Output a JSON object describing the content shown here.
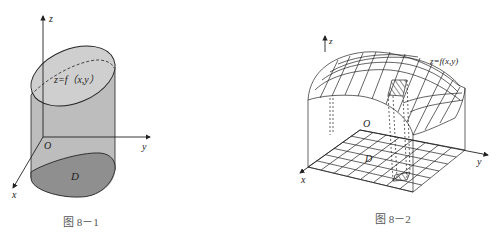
{
  "figures": [
    {
      "caption": "图 8－1",
      "labels": {
        "z_axis": "z",
        "y_axis": "y",
        "x_axis": "x",
        "origin": "O",
        "surface": "z=f（x,y）",
        "region": "D"
      },
      "colors": {
        "side": "#bdbdbd",
        "top": "#cfcfcf",
        "base": "#8f8f8f",
        "stroke": "#222222"
      }
    },
    {
      "caption": "图 8－2",
      "labels": {
        "z_axis": "z",
        "y_axis": "y",
        "x_axis": "x",
        "origin": "O",
        "surface": "z=f(x,y)",
        "region": "D"
      },
      "colors": {
        "stroke": "#222222"
      }
    }
  ]
}
